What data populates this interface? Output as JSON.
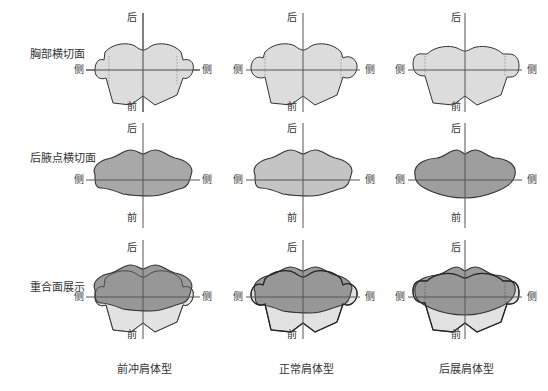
{
  "rows": [
    {
      "label": "胸部横切面"
    },
    {
      "label": "后腋点横切面"
    },
    {
      "label": "重合面展示"
    }
  ],
  "columns": [
    {
      "label": "前冲肩体型"
    },
    {
      "label": "正常肩体型"
    },
    {
      "label": "后展肩体型"
    }
  ],
  "axis_labels": {
    "top": "后",
    "bottom": "前",
    "left": "侧",
    "right": "侧"
  },
  "colors": {
    "chest_fill": "#d6d6d6",
    "armpit_fill_col1": "#a8a8a8",
    "armpit_fill_col2": "#c4c4c4",
    "armpit_fill_col3": "#9e9e9e",
    "overlay_fill": "#8f8f8f",
    "outline": "#333333",
    "axis": "#555555"
  }
}
